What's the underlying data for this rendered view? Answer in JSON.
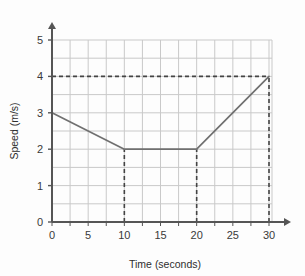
{
  "chart_data": {
    "type": "line",
    "title": "",
    "xlabel": "Time (seconds)",
    "ylabel": "Speed (m/s)",
    "xlim": [
      0,
      30
    ],
    "ylim": [
      0,
      5
    ],
    "xticks": [
      0,
      5,
      10,
      15,
      20,
      25,
      30
    ],
    "yticks": [
      0,
      1,
      2,
      3,
      4,
      5
    ],
    "xtick_labels": [
      "0",
      "5",
      "10",
      "15",
      "20",
      "25",
      "30"
    ],
    "ytick_labels": [
      "0",
      "1",
      "2",
      "3",
      "4",
      "5"
    ],
    "grid": true,
    "grid_step_x": 2.5,
    "grid_step_y": 0.5,
    "legend": null,
    "series": [
      {
        "name": "speed",
        "x": [
          0,
          10,
          20,
          30
        ],
        "values": [
          3,
          2,
          2,
          4
        ]
      }
    ],
    "guide_lines": [
      {
        "name": "speed-4-horizontal-guide",
        "orientation": "horizontal",
        "value": 4,
        "from": 0,
        "to": 30,
        "style": "dashed"
      },
      {
        "name": "time-10-vertical-guide",
        "orientation": "vertical",
        "value": 10,
        "from": 0,
        "to": 2,
        "style": "dashed"
      },
      {
        "name": "time-20-vertical-guide",
        "orientation": "vertical",
        "value": 20,
        "from": 0,
        "to": 2,
        "style": "dashed"
      },
      {
        "name": "time-30-vertical-guide",
        "orientation": "vertical",
        "value": 30,
        "from": 0,
        "to": 4,
        "style": "dashed"
      }
    ],
    "colors": {
      "background": "#fdfdfd",
      "grid": "#c9c9c9",
      "axis": "#555555",
      "data_line": "#707070",
      "dashed_guide": "#444444",
      "text": "#333333"
    }
  },
  "axes": {
    "x_title": "Time (seconds)",
    "y_title": "Speed (m/s)"
  },
  "ticks": {
    "x": [
      "0",
      "5",
      "10",
      "15",
      "20",
      "25",
      "30"
    ],
    "y": [
      "0",
      "1",
      "2",
      "3",
      "4",
      "5"
    ]
  }
}
